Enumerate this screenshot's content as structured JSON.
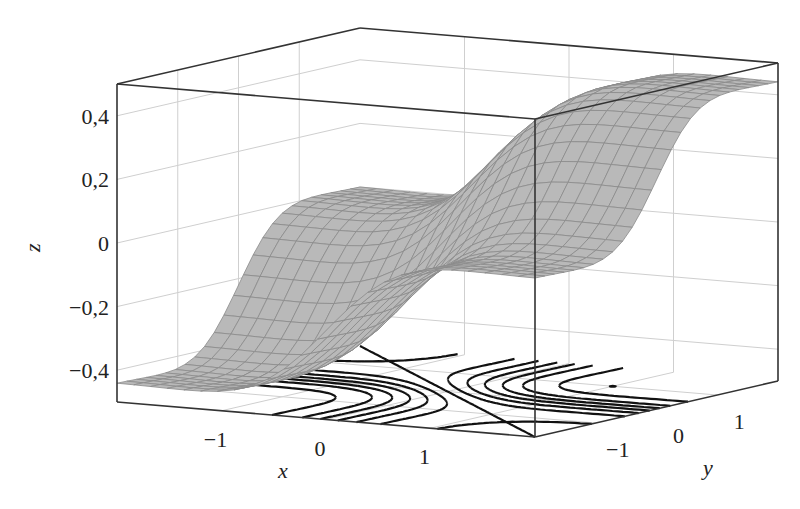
{
  "chart_data": {
    "type": "surface3d",
    "title": "",
    "xlabel": "x",
    "ylabel": "y",
    "zlabel": "z",
    "xlim": [
      -2,
      2
    ],
    "ylim": [
      -2,
      2
    ],
    "zlim": [
      -0.5,
      0.5
    ],
    "x_ticks": [
      -1,
      0,
      1
    ],
    "x_tick_labels": [
      "−1",
      "0",
      "1"
    ],
    "y_ticks": [
      -1,
      0,
      1
    ],
    "y_tick_labels": [
      "−1",
      "0",
      "1"
    ],
    "z_ticks": [
      -0.4,
      -0.2,
      0,
      0.2,
      0.4
    ],
    "z_tick_labels": [
      "−0,4",
      "−0,2",
      "0",
      "0,2",
      "0,4"
    ],
    "grid": true,
    "surface": {
      "description": "Smooth gray meshed surface rising from about -0.4 at low x,y to about 0.45 at high x,y, with a flattened shelf near z=0.1",
      "minimum_near": [
        -1,
        -1
      ],
      "maximum_near": [
        1,
        1
      ],
      "fill_color": "#b9b9b9",
      "mesh_color": "#8a8a8a",
      "mesh_samples": 25
    },
    "contours": {
      "plane": "z = -0.5 (floor)",
      "color": "#111111",
      "levels": [
        -0.38,
        -0.3,
        -0.24,
        -0.18,
        -0.12,
        -0.06,
        0,
        0.06,
        0.12,
        0.18,
        0.24,
        0.3,
        0.38
      ]
    }
  },
  "colors": {
    "box": "#333333",
    "grid": "#cfcfcf",
    "background": "#ffffff"
  }
}
